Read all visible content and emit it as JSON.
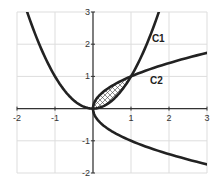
{
  "chart_data": {
    "type": "line",
    "title": "",
    "xlabel": "",
    "ylabel": "",
    "xlim": [
      -2,
      3
    ],
    "ylim": [
      -2,
      3
    ],
    "grid": true,
    "x_ticks": [
      -2,
      -1,
      0,
      1,
      2,
      3
    ],
    "x_tick_labels": [
      "-2",
      "-1",
      "",
      "1",
      "2",
      "3"
    ],
    "y_ticks": [
      -2,
      -1,
      0,
      1,
      2,
      3
    ],
    "y_tick_labels": [
      "-2",
      "-1",
      "",
      "1",
      "2",
      "3"
    ],
    "series": [
      {
        "name": "C1",
        "equation": "y = x^2",
        "x": [
          -1.732,
          -1.5,
          -1.0,
          -0.5,
          0,
          0.5,
          1.0,
          1.5,
          1.732
        ],
        "y": [
          3.0,
          2.25,
          1.0,
          0.25,
          0,
          0.25,
          1.0,
          2.25,
          3.0
        ],
        "label_position": [
          1.55,
          2.2
        ]
      },
      {
        "name": "C2",
        "equation": "x = y^2",
        "x": [
          3.0,
          2.0,
          1.0,
          0.5,
          0.25,
          0,
          0.25,
          0.5,
          1.0,
          2.0,
          3.0
        ],
        "y": [
          1.732,
          1.414,
          1.0,
          0.707,
          0.5,
          0,
          -0.5,
          -0.707,
          -1.0,
          -1.414,
          -1.732
        ],
        "label_position": [
          1.5,
          0.9
        ]
      }
    ],
    "shaded_region": {
      "description": "Region enclosed between C1 and C2 for 0 <= x <= 1",
      "x_range": [
        0,
        1
      ],
      "upper": "y = sqrt(x)",
      "lower": "y = x^2",
      "pattern": "crosshatch",
      "intersections": [
        [
          0,
          0
        ],
        [
          1,
          1
        ]
      ]
    },
    "legend": null
  },
  "labels": {
    "c1": "C1",
    "c2": "C2",
    "x_ticks": [
      "-2",
      "-1",
      "1",
      "2",
      "3"
    ],
    "y_ticks": [
      "3",
      "2",
      "1",
      "-1",
      "-2"
    ]
  },
  "colors": {
    "curve": "#222222",
    "grid": "#dddddd",
    "axis": "#333333",
    "background": "#ffffff"
  }
}
